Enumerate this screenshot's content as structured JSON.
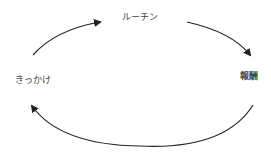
{
  "diagram": {
    "type": "cycle",
    "nodes": [
      {
        "id": "cue",
        "label": "きっかけ"
      },
      {
        "id": "routine",
        "label": "ルーチン"
      },
      {
        "id": "reward",
        "label": "報酬"
      }
    ],
    "edges": [
      {
        "from": "cue",
        "to": "routine"
      },
      {
        "from": "routine",
        "to": "reward"
      },
      {
        "from": "reward",
        "to": "cue"
      }
    ],
    "colors": {
      "arrow": "#222222",
      "text": "#444444",
      "background": "#ffffff"
    }
  }
}
